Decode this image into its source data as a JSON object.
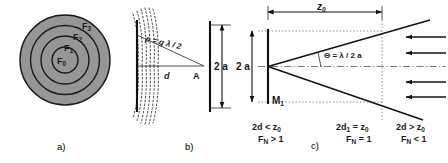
{
  "figure": {
    "panels": [
      {
        "id": "a",
        "caption": "a)",
        "title": "fresnel-zone-plate",
        "zone_labels": [
          "F",
          "F",
          "F",
          "F"
        ],
        "zones": [
          {
            "label_base": "F",
            "label_sub": "3"
          },
          {
            "label_base": "F",
            "label_sub": "2"
          },
          {
            "label_base": "F",
            "label_sub": "1"
          },
          {
            "label_base": "F",
            "label_sub": "0"
          }
        ]
      },
      {
        "id": "b",
        "caption": "b)",
        "title": "wavefront-path-difference",
        "rho_label": "ρ = q λ / 2",
        "distance_label": "d",
        "point_label": "A",
        "aperture_label": "2 a"
      },
      {
        "id": "c",
        "caption": "c)",
        "title": "rayleigh-range-divergence",
        "z0_label": "z",
        "z0_sub": "0",
        "aperture_label": "2 a",
        "mirror_label": "M",
        "mirror_sub": "1",
        "theta_label": "Θ = λ / 2 a",
        "conditions": [
          {
            "top": "2d < z",
            "top_sub": "0",
            "bottom_base": "F",
            "bottom_sub": "N",
            "bottom_rel": "> 1"
          },
          {
            "top": "2d",
            "top_sub2": "1",
            "top_rest": "= z",
            "top_sub": "0",
            "bottom_base": "F",
            "bottom_sub": "N",
            "bottom_rel": "= 1"
          },
          {
            "top": "2d > z",
            "top_sub": "0",
            "bottom_base": "F",
            "bottom_sub": "N",
            "bottom_rel": "< 1"
          }
        ],
        "beam_arrow_count": 4
      }
    ],
    "colors": {
      "zone_gray": "#969696",
      "ink": "#111111",
      "guide_gray": "#777777"
    }
  }
}
